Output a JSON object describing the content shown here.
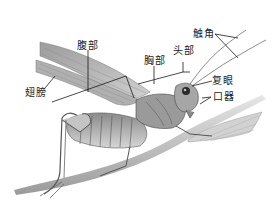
{
  "diagram": {
    "labels": {
      "antenna": "触角",
      "head": "头部",
      "thorax": "胸部",
      "abdomen": "腹部",
      "wings": "翅膀",
      "compound_eye": "复眼",
      "mouthparts": "口器"
    },
    "colors": {
      "line": "#1a1a1a",
      "body_dark": "#6e6e6e",
      "body_mid": "#a0a0a0",
      "body_light": "#d8d8d8",
      "wing": "#b8b8b8",
      "stem": "#c8c8c8",
      "background": "#ffffff"
    }
  }
}
